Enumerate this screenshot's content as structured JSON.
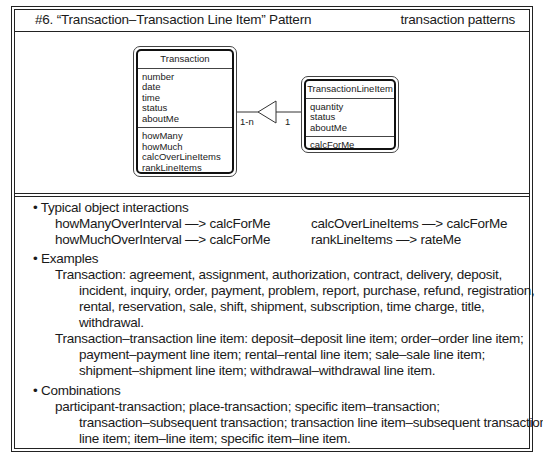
{
  "header": {
    "title": "#6. “Transaction–Transaction Line Item” Pattern",
    "category": "transaction patterns"
  },
  "diagram": {
    "classes": [
      {
        "name": "Transaction",
        "attributes": [
          "number",
          "date",
          "time",
          "status",
          "aboutMe"
        ],
        "services": [
          "howMany",
          "howMuch",
          "calcOverLineItems",
          "rankLineItems",
          "calcForMe"
        ]
      },
      {
        "name": "TransactionLineItem",
        "attributes": [
          "quantity",
          "status",
          "aboutMe"
        ],
        "services": [
          "calcForMe",
          "rateMe"
        ]
      }
    ],
    "association": {
      "type": "whole-part",
      "whole_multiplicity": "1-n",
      "part_multiplicity": "1"
    }
  },
  "sections": {
    "interactions": {
      "heading": "• Typical object interactions",
      "items": [
        "howManyOverInterval —> calcForMe",
        "calcOverLineItems —> calcForMe",
        "howMuchOverInterval —> calcForMe",
        "rankLineItems —> rateMe"
      ]
    },
    "examples": {
      "heading": "• Examples",
      "lines": [
        "Transaction: agreement, assignment, authorization, contract, delivery, deposit,",
        "incident, inquiry, order, payment, problem, report, purchase, refund, registration,",
        "rental, reservation, sale, shift, shipment, subscription, time charge, title,",
        "withdrawal.",
        "Transaction–transaction line item: deposit–deposit line item; order–order line item;",
        "payment–payment line item; rental–rental line item; sale–sale line item;",
        "shipment–shipment line item; withdrawal–withdrawal line item."
      ]
    },
    "combinations": {
      "heading": "• Combinations",
      "lines": [
        "participant-transaction; place-transaction; specific item–transaction;",
        "transaction–subsequent transaction; transaction line item–subsequent transaction",
        "line item; item–line item; specific item–line item."
      ]
    }
  }
}
